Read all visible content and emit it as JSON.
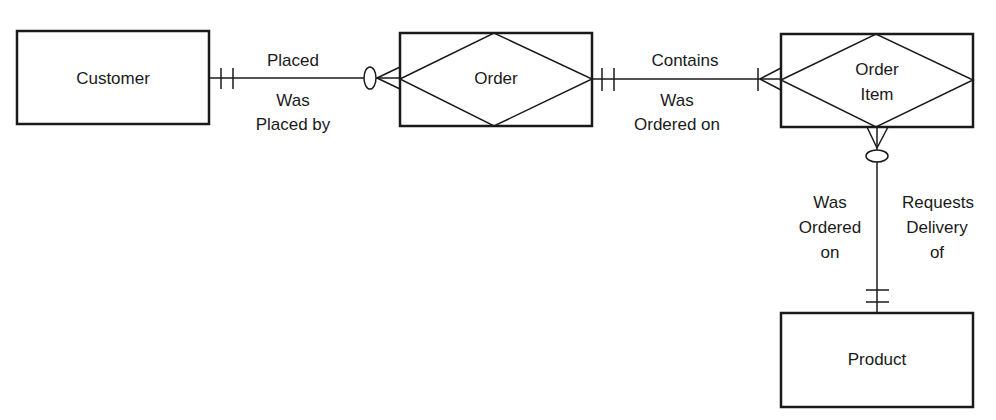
{
  "diagram": {
    "type": "entity-relationship",
    "entities": [
      {
        "id": "customer",
        "label": "Customer",
        "kind": "entity"
      },
      {
        "id": "order",
        "label": "Order",
        "kind": "associative-entity"
      },
      {
        "id": "order_item",
        "label_line1": "Order",
        "label_line2": "Item",
        "kind": "associative-entity"
      },
      {
        "id": "product",
        "label": "Product",
        "kind": "entity"
      }
    ],
    "relationships": [
      {
        "from": "customer",
        "to": "order",
        "forward_label": "Placed",
        "reverse_label_line1": "Was",
        "reverse_label_line2": "Placed by",
        "from_cardinality": "one-and-only-one",
        "to_cardinality": "zero-or-many"
      },
      {
        "from": "order",
        "to": "order_item",
        "forward_label": "Contains",
        "reverse_label_line1": "Was",
        "reverse_label_line2": "Ordered on",
        "from_cardinality": "one-and-only-one",
        "to_cardinality": "one-or-many"
      },
      {
        "from": "product",
        "to": "order_item",
        "left_label_line1": "Was",
        "left_label_line2": "Ordered",
        "left_label_line3": "on",
        "right_label_line1": "Requests",
        "right_label_line2": "Delivery",
        "right_label_line3": "of",
        "from_cardinality": "one-and-only-one",
        "to_cardinality": "zero-or-many"
      }
    ],
    "colors": {
      "stroke": "#1a1a1a",
      "background": "#ffffff"
    }
  }
}
